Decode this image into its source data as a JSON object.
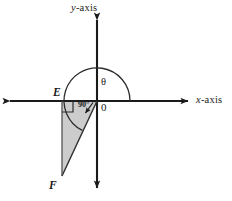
{
  "figure": {
    "type": "coordinate-plane-geometry-diagram",
    "background_color": "#ffffff",
    "stroke_color": "#1a1a1a",
    "triangle_fill_color": "#cccccc"
  },
  "axes": {
    "y_axis_label": "y-axis",
    "y_axis_label_italic_part": "y",
    "y_axis_label_rest": "-axis",
    "x_axis_label": "x-axis",
    "x_axis_label_italic_part": "x",
    "x_axis_label_rest": "-axis",
    "origin_label": "0"
  },
  "points": {
    "E": "E",
    "F": "F"
  },
  "angles": {
    "theta": "θ",
    "right_angle": "90°"
  },
  "geometry": {
    "origin": {
      "x": 97,
      "y": 101
    },
    "E": {
      "x": 62,
      "y": 101
    },
    "F": {
      "x": 62,
      "y": 176
    },
    "x_axis_span": [
      8,
      190
    ],
    "y_axis_span": [
      18,
      190
    ],
    "arc_radius": 33
  }
}
